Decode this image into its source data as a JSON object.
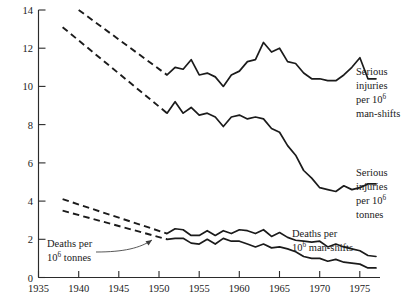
{
  "chart_data": {
    "type": "line",
    "title": "",
    "subtitle": "",
    "xlabel": "",
    "ylabel": "",
    "xlim": [
      1935,
      1977.5
    ],
    "ylim": [
      0,
      14
    ],
    "grid": false,
    "legend_position": "inline-right-annotations",
    "x_ticks": [
      1935,
      1940,
      1945,
      1950,
      1955,
      1960,
      1965,
      1970,
      1975
    ],
    "x_tick_labels": [
      "1935",
      "1940",
      "1945",
      "1950",
      "1955",
      "1960",
      "1965",
      "1970",
      "1975"
    ],
    "y_ticks": [
      0,
      2,
      4,
      6,
      8,
      10,
      12,
      14
    ],
    "y_tick_labels": [
      "0",
      "2",
      "4",
      "6",
      "8",
      "10",
      "12",
      "14"
    ],
    "series": [
      {
        "name": "Serious injuries per 10^6 man-shifts",
        "label_lines": [
          "Serious",
          "injuries",
          "per 10",
          "man-shifts"
        ],
        "label_superscript": "6",
        "style_early": "dashed",
        "style_late": "solid",
        "dashed_x": [
          1940,
          1951
        ],
        "dashed_y": [
          14.0,
          10.6
        ],
        "x": [
          1951,
          1952,
          1953,
          1954,
          1955,
          1956,
          1957,
          1958,
          1959,
          1960,
          1961,
          1962,
          1963,
          1964,
          1965,
          1966,
          1967,
          1968,
          1969,
          1970,
          1971,
          1972,
          1973,
          1974,
          1975,
          1976,
          1977
        ],
        "y": [
          10.6,
          11.0,
          10.9,
          11.4,
          10.6,
          10.7,
          10.5,
          10.0,
          10.6,
          10.8,
          11.3,
          11.4,
          12.3,
          11.8,
          12.0,
          11.3,
          11.2,
          10.7,
          10.4,
          10.4,
          10.3,
          10.3,
          10.6,
          11.0,
          11.5,
          10.4,
          10.4
        ]
      },
      {
        "name": "Serious injuries per 10^6 tonnes",
        "label_lines": [
          "Serious",
          "injuries",
          "per 10",
          "tonnes"
        ],
        "label_superscript": "6",
        "style_early": "dashed",
        "style_late": "solid",
        "dashed_x": [
          1938,
          1951
        ],
        "dashed_y": [
          13.1,
          8.6
        ],
        "x": [
          1951,
          1952,
          1953,
          1954,
          1955,
          1956,
          1957,
          1958,
          1959,
          1960,
          1961,
          1962,
          1963,
          1964,
          1965,
          1966,
          1967,
          1968,
          1969,
          1970,
          1971,
          1972,
          1973,
          1974,
          1975,
          1976,
          1977
        ],
        "y": [
          8.6,
          9.2,
          8.6,
          8.9,
          8.5,
          8.6,
          8.4,
          7.9,
          8.4,
          8.5,
          8.3,
          8.4,
          8.3,
          7.8,
          7.6,
          6.9,
          6.4,
          5.6,
          5.2,
          4.7,
          4.6,
          4.5,
          4.8,
          4.6,
          4.7,
          4.9,
          4.9
        ]
      },
      {
        "name": "Deaths per 10^6 man-shifts",
        "label_lines": [
          "Deaths per",
          "10",
          "man-shifts"
        ],
        "label_superscript": "6",
        "style_early": "dashed",
        "style_late": "solid",
        "dashed_x": [
          1938,
          1951
        ],
        "dashed_y": [
          4.1,
          2.3
        ],
        "x": [
          1951,
          1952,
          1953,
          1954,
          1955,
          1956,
          1957,
          1958,
          1959,
          1960,
          1961,
          1962,
          1963,
          1964,
          1965,
          1966,
          1967,
          1968,
          1969,
          1970,
          1971,
          1972,
          1973,
          1974,
          1975,
          1976,
          1977
        ],
        "y": [
          2.3,
          2.55,
          2.5,
          2.2,
          2.2,
          2.45,
          2.2,
          2.45,
          2.3,
          2.5,
          2.45,
          2.3,
          2.5,
          2.15,
          2.35,
          2.1,
          1.95,
          1.9,
          1.85,
          1.9,
          1.6,
          1.75,
          1.6,
          1.5,
          1.4,
          1.15,
          1.1
        ]
      },
      {
        "name": "Deaths per 10^6 tonnes",
        "label_lines": [
          "Deaths per",
          "10",
          "tonnes"
        ],
        "label_superscript": "6",
        "style_early": "dashed",
        "style_late": "solid",
        "dashed_x": [
          1938,
          1951
        ],
        "dashed_y": [
          3.5,
          2.0
        ],
        "x": [
          1951,
          1952,
          1953,
          1954,
          1955,
          1956,
          1957,
          1958,
          1959,
          1960,
          1961,
          1962,
          1963,
          1964,
          1965,
          1966,
          1967,
          1968,
          1969,
          1970,
          1971,
          1972,
          1973,
          1974,
          1975,
          1976,
          1977
        ],
        "y": [
          2.0,
          2.05,
          2.05,
          1.8,
          1.75,
          2.0,
          1.75,
          2.05,
          1.9,
          1.9,
          1.75,
          1.6,
          1.75,
          1.55,
          1.6,
          1.5,
          1.35,
          1.1,
          1.0,
          1.0,
          0.85,
          0.95,
          0.8,
          0.75,
          0.7,
          0.5,
          0.5
        ]
      }
    ],
    "annotations": [
      {
        "id": "deaths-per-tonnes",
        "lines": [
          "Deaths per",
          "10",
          "tonnes"
        ],
        "superscript": "6",
        "has_arrow": true
      },
      {
        "id": "deaths-per-man-shifts",
        "lines": [
          "Deaths per",
          "10",
          "man-shifts"
        ],
        "superscript": "6",
        "has_arrow": false
      },
      {
        "id": "serious-injuries-man-shifts",
        "lines": [
          "Serious",
          "injuries",
          "per 10",
          "man-shifts"
        ],
        "superscript": "6",
        "has_arrow": false
      },
      {
        "id": "serious-injuries-tonnes",
        "lines": [
          "Serious",
          "injuries",
          "per 10",
          "tonnes"
        ],
        "superscript": "6",
        "has_arrow": false
      }
    ],
    "colors": {
      "line": "#1b1b1b",
      "axis": "#2b2b2b",
      "background": "#ffffff",
      "text": "#1a1a1a"
    }
  },
  "labels": {
    "serious_injuries_man_shifts": {
      "l1": "Serious",
      "l2": "injuries",
      "l3a": "per 10",
      "l3b": "6",
      "l4": "man-shifts"
    },
    "serious_injuries_tonnes": {
      "l1": "Serious",
      "l2": "injuries",
      "l3a": "per 10",
      "l3b": "6",
      "l4": "tonnes"
    },
    "deaths_man_shifts": {
      "l1": "Deaths per",
      "l2a": "10",
      "l2b": "6",
      "l2c": "man-shifts"
    },
    "deaths_tonnes": {
      "l1": "Deaths per",
      "l2a": "10",
      "l2b": "6",
      "l2c": "tonnes"
    }
  },
  "axes": {
    "x_tick_labels": [
      "1935",
      "1940",
      "1945",
      "1950",
      "1955",
      "1960",
      "1965",
      "1970",
      "1975"
    ],
    "y_tick_labels": [
      "0",
      "2",
      "4",
      "6",
      "8",
      "10",
      "12",
      "14"
    ]
  }
}
